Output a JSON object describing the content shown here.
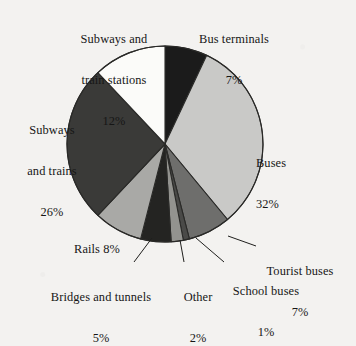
{
  "chart_data": {
    "type": "pie",
    "title": "",
    "subtitle": "",
    "xlabel": "",
    "ylabel": "",
    "legend_position": "none",
    "grid": false,
    "units": "%",
    "total": 100,
    "start_angle_deg": 0,
    "direction": "clockwise",
    "categories": [
      "Bus terminals",
      "Buses",
      "Tourist buses",
      "School buses",
      "Other",
      "Bridges and tunnels",
      "Rails",
      "Subways and trains",
      "Subways and train stations"
    ],
    "values": [
      7,
      32,
      7,
      1,
      2,
      5,
      8,
      26,
      12
    ],
    "slices": [
      {
        "label": "Bus terminals",
        "value": 7,
        "value_text": "7%",
        "color": "#1b1b1b",
        "label_lines": [
          "Bus terminals",
          "7%"
        ],
        "leader": false
      },
      {
        "label": "Buses",
        "value": 32,
        "value_text": "32%",
        "color": "#c9c9c7",
        "label_lines": [
          "Buses",
          "32%"
        ],
        "leader": false
      },
      {
        "label": "Tourist buses",
        "value": 7,
        "value_text": "7%",
        "color": "#6e6e6c",
        "label_lines": [
          "Tourist buses",
          "7%"
        ],
        "leader": true
      },
      {
        "label": "School buses",
        "value": 1,
        "value_text": "1%",
        "color": "#4a4a48",
        "label_lines": [
          "School buses",
          "1%"
        ],
        "leader": true
      },
      {
        "label": "Other",
        "value": 2,
        "value_text": "2%",
        "color": "#93938f",
        "label_lines": [
          "Other",
          "2%"
        ],
        "leader": true
      },
      {
        "label": "Bridges and tunnels",
        "value": 5,
        "value_text": "5%",
        "color": "#242422",
        "label_lines": [
          "Bridges and tunnels",
          "5%"
        ],
        "leader": true
      },
      {
        "label": "Rails",
        "value": 8,
        "value_text": "8%",
        "color": "#a9a9a6",
        "label_lines": [
          "Rails 8%"
        ],
        "leader": false
      },
      {
        "label": "Subways and trains",
        "value": 26,
        "value_text": "26%",
        "color": "#3a3a38",
        "label_lines": [
          "Subways",
          "and trains",
          "26%"
        ],
        "leader": false
      },
      {
        "label": "Subways and train stations",
        "value": 12,
        "value_text": "12%",
        "color": "#fbfbf9",
        "label_lines": [
          "Subways and",
          "train stations",
          "12%"
        ],
        "leader": false
      }
    ],
    "geometry": {
      "center_x": 165,
      "center_y": 144,
      "radius": 98,
      "outline_color": "#2a2a28",
      "outline_width": 1.1
    },
    "background_color": "#f3f2f0",
    "text_color": "#161616"
  },
  "labels": {
    "subways_stations": {
      "l1": "Subways and",
      "l2": "train stations",
      "l3": "12%"
    },
    "bus_terminals": {
      "l1": "Bus terminals",
      "l2": "7%"
    },
    "buses": {
      "l1": "Buses",
      "l2": "32%"
    },
    "subways_trains": {
      "l1": "Subways",
      "l2": "and trains",
      "l3": "26%"
    },
    "rails": {
      "l1": "Rails 8%"
    },
    "bridges": {
      "l1": "Bridges and tunnels",
      "l2": "5%"
    },
    "other": {
      "l1": "Other",
      "l2": "2%"
    },
    "school_buses": {
      "l1": "School buses",
      "l2": "1%"
    },
    "tourist_buses": {
      "l1": "Tourist buses",
      "l2": "7%"
    }
  }
}
